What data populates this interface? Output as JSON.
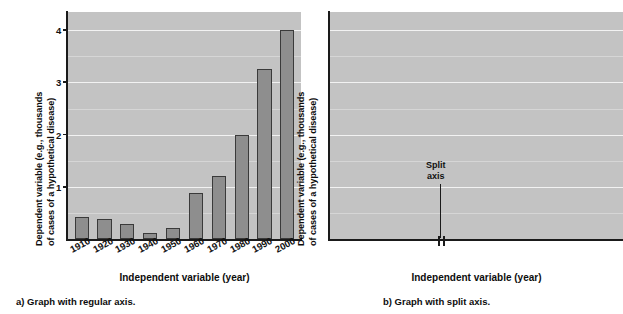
{
  "figure": {
    "panels": [
      {
        "id": "a",
        "caption": "a) Graph with regular axis.",
        "ylabel_line1": "Dependent variable (e.g., thousands",
        "ylabel_line2": "of cases of a hypothetical disease)",
        "xlabel": "Independent variable (year)"
      },
      {
        "id": "b",
        "caption": "b) Graph with split axis.",
        "ylabel_line1": "Dependent variable (e.g., thousands",
        "ylabel_line2": "of cases of a hypothetical disease)",
        "xlabel": "Independent variable (year)",
        "annotation_line1": "Split",
        "annotation_line2": "axis"
      }
    ],
    "colors": {
      "plot_background": "#c3c3c3",
      "bar_fill": "#8e8e8e",
      "bar_stroke": "#3a3a3a",
      "gridline_major": "#f2f2f2",
      "gridline_minor": "#d6d6d6",
      "axis": "#1a1a1a",
      "page_background": "#ffffff"
    }
  },
  "chart_data": [
    {
      "type": "bar",
      "title": "a) Graph with regular axis.",
      "xlabel": "Independent variable (year)",
      "ylabel": "Dependent variable (e.g., thousands of cases of a hypothetical disease)",
      "categories": [
        "1910",
        "1920",
        "1930",
        "1940",
        "1950",
        "1960",
        "1970",
        "1980",
        "1990",
        "2000"
      ],
      "values": [
        0.42,
        0.38,
        0.28,
        0.12,
        0.22,
        0.88,
        1.2,
        2.0,
        3.25,
        4.0
      ],
      "ylim": [
        0,
        4.35
      ],
      "yticks": [
        1,
        2,
        3,
        4
      ],
      "ytick_labels": [
        "1",
        "2",
        "3",
        "4"
      ],
      "minor_gridlines": [
        0.5,
        1.5,
        2.5,
        3.5
      ],
      "grid": true,
      "legend": "none",
      "axis_style": "regular"
    },
    {
      "type": "bar",
      "title": "b) Graph with split axis.",
      "xlabel": "Independent variable (year)",
      "ylabel": "Dependent variable (e.g., thousands of cases of a hypothetical disease)",
      "categories": [
        "1910",
        "1960",
        "1970",
        "1980",
        "1990",
        "2000"
      ],
      "values": [
        0.42,
        0.88,
        1.2,
        2.0,
        3.25,
        4.0
      ],
      "ylim": [
        0,
        4.35
      ],
      "yticks": [
        1,
        2,
        3,
        4
      ],
      "ytick_labels": [
        "1",
        "2",
        "3",
        "4"
      ],
      "minor_gridlines": [
        0.5,
        1.5,
        2.5,
        3.5
      ],
      "grid": true,
      "legend": "none",
      "axis_style": "split",
      "split_between": [
        "1910",
        "1960"
      ],
      "annotation": "Split axis"
    }
  ]
}
